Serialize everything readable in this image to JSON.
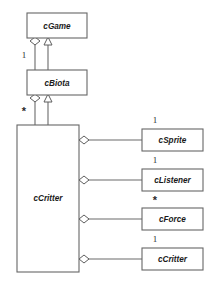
{
  "diagram": {
    "type": "uml-class-diagram",
    "background_color": "#ffffff",
    "box_fill": "#ffffff",
    "box_stroke": "#666666",
    "line_color": "#6b6b6b",
    "text_color": "#1a1a1a",
    "classes": [
      {
        "id": "cGame",
        "name": "cGame",
        "x": 27,
        "y": 13,
        "w": 60,
        "h": 25
      },
      {
        "id": "cBiota",
        "name": "cBiota",
        "x": 27,
        "y": 70,
        "w": 60,
        "h": 25
      },
      {
        "id": "cCritter",
        "name": "cCritter",
        "x": 17,
        "y": 125,
        "w": 62,
        "h": 147
      },
      {
        "id": "cSprite",
        "name": "cSprite",
        "x": 142,
        "y": 129,
        "w": 61,
        "h": 22
      },
      {
        "id": "cListener",
        "name": "cListener",
        "x": 142,
        "y": 169,
        "w": 61,
        "h": 22
      },
      {
        "id": "cForce",
        "name": "cForce",
        "x": 142,
        "y": 208,
        "w": 61,
        "h": 22
      },
      {
        "id": "cCritterRef",
        "name": "cCritter",
        "x": 142,
        "y": 248,
        "w": 61,
        "h": 22
      }
    ],
    "multiplicities": [
      {
        "id": "mult-game-biota",
        "label": "1",
        "x": 24,
        "y": 56,
        "style": "number"
      },
      {
        "id": "mult-biota-critter",
        "label": "*",
        "x": 24,
        "y": 111,
        "style": "star"
      },
      {
        "id": "mult-critter-sprite",
        "label": "1",
        "x": 155,
        "y": 121,
        "style": "number"
      },
      {
        "id": "mult-critter-listener",
        "label": "1",
        "x": 155,
        "y": 161,
        "style": "number"
      },
      {
        "id": "mult-critter-force",
        "label": "*",
        "x": 155,
        "y": 200,
        "style": "star"
      },
      {
        "id": "mult-critter-critter",
        "label": "1",
        "x": 155,
        "y": 240,
        "style": "number"
      }
    ],
    "relationships": [
      {
        "id": "agg-game-biota",
        "kind": "aggregation",
        "from": "cBiota",
        "to": "cGame",
        "multiplicity": "1"
      },
      {
        "id": "gen-biota-game",
        "kind": "generalization",
        "from": "cBiota",
        "to": "cGame",
        "multiplicity": ""
      },
      {
        "id": "agg-biota-critter",
        "kind": "aggregation",
        "from": "cCritter",
        "to": "cBiota",
        "multiplicity": "*"
      },
      {
        "id": "gen-critter-biota",
        "kind": "generalization",
        "from": "cCritter",
        "to": "cBiota",
        "multiplicity": ""
      },
      {
        "id": "agg-critter-sprite",
        "kind": "aggregation",
        "from": "cCritter",
        "to": "cSprite",
        "multiplicity": "1"
      },
      {
        "id": "agg-critter-listener",
        "kind": "aggregation",
        "from": "cCritter",
        "to": "cListener",
        "multiplicity": "1"
      },
      {
        "id": "agg-critter-force",
        "kind": "aggregation",
        "from": "cCritter",
        "to": "cForce",
        "multiplicity": "*"
      },
      {
        "id": "agg-critter-critter",
        "kind": "aggregation",
        "from": "cCritter",
        "to": "cCritterRef",
        "multiplicity": "1"
      }
    ]
  }
}
